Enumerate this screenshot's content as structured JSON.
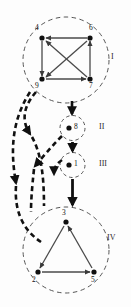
{
  "figure": {
    "background": "#fdfdfd",
    "ink": "#1a1a1a",
    "edge_color": "#4a4a4a",
    "dash_color": "#111111"
  },
  "clusters": [
    {
      "id": "I",
      "label": "I",
      "cx": 66,
      "cy": 60,
      "r": 43,
      "label_x": 110,
      "label_y": 56
    },
    {
      "id": "II",
      "label": "II",
      "cx": 73,
      "cy": 128,
      "r": 13,
      "label_x": 99,
      "label_y": 124
    },
    {
      "id": "III",
      "label": "III",
      "cx": 73,
      "cy": 165,
      "r": 13,
      "label_x": 99,
      "label_y": 161
    },
    {
      "id": "IV",
      "label": "IV",
      "cx": 66,
      "cy": 250,
      "r": 43,
      "label_x": 108,
      "label_y": 235
    }
  ],
  "nodes": [
    {
      "id": "4",
      "label": "4",
      "x": 42,
      "y": 38,
      "lx": 36,
      "ly": 26,
      "cluster": "I"
    },
    {
      "id": "6",
      "label": "6",
      "x": 90,
      "y": 38,
      "lx": 90,
      "ly": 26,
      "cluster": "I"
    },
    {
      "id": "9",
      "label": "9",
      "x": 42,
      "y": 79,
      "lx": 36,
      "ly": 82,
      "cluster": "I"
    },
    {
      "id": "7",
      "label": "7",
      "x": 90,
      "y": 79,
      "lx": 90,
      "ly": 82,
      "cluster": "I"
    },
    {
      "id": "8",
      "label": "8",
      "x": 70,
      "y": 128,
      "lx": 75,
      "ly": 124,
      "cluster": "II"
    },
    {
      "id": "1",
      "label": "1",
      "x": 70,
      "y": 165,
      "lx": 75,
      "ly": 161,
      "cluster": "III"
    },
    {
      "id": "3",
      "label": "3",
      "x": 66,
      "y": 222,
      "lx": 62,
      "ly": 210,
      "cluster": "IV"
    },
    {
      "id": "2",
      "label": "2",
      "x": 38,
      "y": 272,
      "lx": 33,
      "ly": 276,
      "cluster": "IV"
    },
    {
      "id": "5",
      "label": "5",
      "x": 94,
      "y": 272,
      "lx": 92,
      "ly": 276,
      "cluster": "IV"
    }
  ],
  "edges": [
    {
      "from": "6",
      "to": "4",
      "kind": "solid"
    },
    {
      "from": "4",
      "to": "9",
      "kind": "solid"
    },
    {
      "from": "7",
      "to": "6",
      "kind": "solid"
    },
    {
      "from": "9",
      "to": "7",
      "kind": "solid"
    },
    {
      "from": "6",
      "to": "9",
      "kind": "solid"
    },
    {
      "from": "7",
      "to": "4",
      "kind": "solid"
    },
    {
      "from": "3",
      "to": "2",
      "kind": "solid"
    },
    {
      "from": "5",
      "to": "3",
      "kind": "solid"
    },
    {
      "from": "2",
      "to": "5",
      "kind": "solid"
    }
  ],
  "cluster_edges": [
    {
      "from": "I",
      "to": "II",
      "kind": "solid-thick"
    },
    {
      "from": "II",
      "to": "III",
      "kind": "solid-thick"
    },
    {
      "from": "III",
      "to": "IV",
      "kind": "solid-thick"
    },
    {
      "from": "I",
      "to": "IV",
      "kind": "dashed-thick"
    },
    {
      "from": "I",
      "to": "IV",
      "kind": "dashed-thick"
    },
    {
      "from": "II",
      "to": "IV",
      "kind": "dashed-thick"
    },
    {
      "from": "III",
      "to": "IV",
      "kind": "dashed-thick"
    }
  ]
}
